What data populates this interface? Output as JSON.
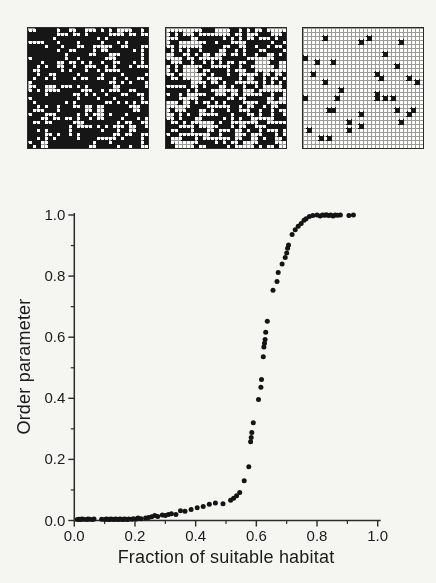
{
  "figure": {
    "background_color": "#f5f5f1",
    "lattices": {
      "colors": {
        "suitable": "#ffffff",
        "unsuitable": "#161616",
        "mesh": "#9b9b97",
        "border": "#2a2a2a"
      },
      "items": [
        {
          "id": "low",
          "rows": 30,
          "cols": 30,
          "suitable_fraction": 0.37,
          "seed": 7
        },
        {
          "id": "mid",
          "rows": 30,
          "cols": 30,
          "suitable_fraction": 0.57,
          "seed": 13
        },
        {
          "id": "high",
          "rows": 30,
          "cols": 30,
          "suitable_fraction": 0.96,
          "seed": 41
        }
      ]
    }
  },
  "chart_data": {
    "type": "scatter",
    "title": "",
    "xlabel": "Fraction of suitable habitat",
    "ylabel": "Order parameter",
    "xlim": [
      0.0,
      1.0
    ],
    "ylim": [
      0.0,
      1.0
    ],
    "x_tick_labels": [
      "0.0",
      "0.2",
      "0.4",
      "0.6",
      "0.8",
      "1.0"
    ],
    "y_tick_labels": [
      "0.0",
      "0.2",
      "0.4",
      "0.6",
      "0.8",
      "1.0"
    ],
    "minor_ticks_every": 0.1,
    "grid": false,
    "legend": null,
    "axis_color": "#2b2b2b",
    "marker": {
      "shape": "circle",
      "color": "#141414",
      "radius_px": 2.5
    },
    "points": [
      [
        0.01,
        0.003
      ],
      [
        0.015,
        0.004
      ],
      [
        0.02,
        0.003
      ],
      [
        0.025,
        0.005
      ],
      [
        0.03,
        0.004
      ],
      [
        0.04,
        0.003
      ],
      [
        0.045,
        0.005
      ],
      [
        0.05,
        0.004
      ],
      [
        0.06,
        0.003
      ],
      [
        0.065,
        0.005
      ],
      [
        0.09,
        0.004
      ],
      [
        0.1,
        0.003
      ],
      [
        0.105,
        0.005
      ],
      [
        0.11,
        0.004
      ],
      [
        0.115,
        0.003
      ],
      [
        0.12,
        0.005
      ],
      [
        0.125,
        0.004
      ],
      [
        0.13,
        0.003
      ],
      [
        0.135,
        0.005
      ],
      [
        0.14,
        0.004
      ],
      [
        0.145,
        0.003
      ],
      [
        0.15,
        0.005
      ],
      [
        0.155,
        0.004
      ],
      [
        0.16,
        0.003
      ],
      [
        0.165,
        0.005
      ],
      [
        0.17,
        0.004
      ],
      [
        0.175,
        0.003
      ],
      [
        0.18,
        0.005
      ],
      [
        0.19,
        0.004
      ],
      [
        0.195,
        0.006
      ],
      [
        0.205,
        0.005
      ],
      [
        0.21,
        0.008
      ],
      [
        0.22,
        0.006
      ],
      [
        0.235,
        0.008
      ],
      [
        0.245,
        0.01
      ],
      [
        0.255,
        0.012
      ],
      [
        0.265,
        0.016
      ],
      [
        0.275,
        0.013
      ],
      [
        0.29,
        0.018
      ],
      [
        0.3,
        0.016
      ],
      [
        0.31,
        0.02
      ],
      [
        0.32,
        0.022
      ],
      [
        0.335,
        0.02
      ],
      [
        0.35,
        0.032
      ],
      [
        0.365,
        0.03
      ],
      [
        0.385,
        0.036
      ],
      [
        0.405,
        0.042
      ],
      [
        0.425,
        0.046
      ],
      [
        0.445,
        0.053
      ],
      [
        0.465,
        0.057
      ],
      [
        0.49,
        0.055
      ],
      [
        0.515,
        0.066
      ],
      [
        0.525,
        0.073
      ],
      [
        0.535,
        0.081
      ],
      [
        0.545,
        0.092
      ],
      [
        0.56,
        0.13
      ],
      [
        0.575,
        0.176
      ],
      [
        0.581,
        0.258
      ],
      [
        0.583,
        0.272
      ],
      [
        0.585,
        0.288
      ],
      [
        0.59,
        0.32
      ],
      [
        0.607,
        0.396
      ],
      [
        0.615,
        0.436
      ],
      [
        0.617,
        0.462
      ],
      [
        0.623,
        0.536
      ],
      [
        0.625,
        0.568
      ],
      [
        0.627,
        0.58
      ],
      [
        0.629,
        0.592
      ],
      [
        0.631,
        0.616
      ],
      [
        0.636,
        0.652
      ],
      [
        0.655,
        0.754
      ],
      [
        0.668,
        0.782
      ],
      [
        0.672,
        0.812
      ],
      [
        0.685,
        0.84
      ],
      [
        0.695,
        0.861
      ],
      [
        0.7,
        0.876
      ],
      [
        0.703,
        0.891
      ],
      [
        0.706,
        0.902
      ],
      [
        0.718,
        0.936
      ],
      [
        0.728,
        0.952
      ],
      [
        0.738,
        0.963
      ],
      [
        0.748,
        0.972
      ],
      [
        0.757,
        0.983
      ],
      [
        0.764,
        0.988
      ],
      [
        0.775,
        0.995
      ],
      [
        0.786,
        0.998
      ],
      [
        0.8,
        1.0
      ],
      [
        0.81,
        0.997
      ],
      [
        0.818,
        1.0
      ],
      [
        0.825,
        0.999
      ],
      [
        0.831,
        1.001
      ],
      [
        0.838,
        0.998
      ],
      [
        0.845,
        1.0
      ],
      [
        0.853,
        0.997
      ],
      [
        0.86,
        1.0
      ],
      [
        0.868,
        0.999
      ],
      [
        0.877,
        1.0
      ],
      [
        0.905,
        0.998
      ],
      [
        0.92,
        1.0
      ]
    ]
  }
}
